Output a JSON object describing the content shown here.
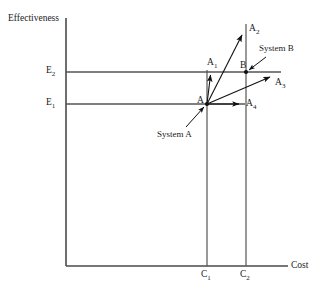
{
  "figure": {
    "background_color": "#ffffff",
    "line_color": "#555555",
    "vector_color": "#111111"
  },
  "axes": {
    "y_axis_label": "Effectiveness",
    "x_axis_label": "Cost",
    "y_ticks": [
      {
        "label_main": "E",
        "label_sub": "2",
        "value_y": 72
      },
      {
        "label_main": "E",
        "label_sub": "1",
        "value_y": 104
      }
    ],
    "x_ticks": [
      {
        "label_main": "C",
        "label_sub": "1",
        "value_x": 207
      },
      {
        "label_main": "C",
        "label_sub": "2",
        "value_x": 246
      }
    ]
  },
  "points": [
    {
      "name": "A",
      "label_main": "A",
      "label_sub": "",
      "x": 207,
      "y": 104
    },
    {
      "name": "B",
      "label_main": "B",
      "label_sub": "",
      "x": 246,
      "y": 72
    }
  ],
  "vectors": [
    {
      "name": "A1",
      "label_main": "A",
      "label_sub": "1",
      "from": "A",
      "to_x": 211,
      "to_y": 74
    },
    {
      "name": "A2",
      "label_main": "A",
      "label_sub": "2",
      "from": "A",
      "to_x": 243,
      "to_y": 33
    },
    {
      "name": "A3",
      "label_main": "A",
      "label_sub": "3",
      "from": "A",
      "to_x": 272,
      "to_y": 76
    },
    {
      "name": "A4",
      "label_main": "A",
      "label_sub": "4",
      "from": "A",
      "to_x": 240,
      "to_y": 104
    }
  ],
  "annotations": [
    {
      "name": "system-a",
      "text": "System A",
      "target_point": "A"
    },
    {
      "name": "system-b",
      "text": "System B",
      "target_point": "B"
    }
  ]
}
